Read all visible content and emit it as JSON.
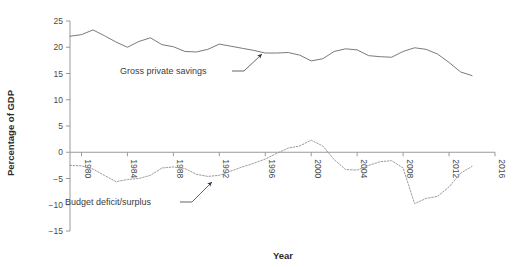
{
  "chart_data": {
    "type": "line",
    "title": "",
    "subtitle": "",
    "xlabel": "Year",
    "ylabel": "Percentage of GDP",
    "xlim": [
      1979,
      2016
    ],
    "ylim": [
      -15,
      25
    ],
    "xticks": [
      "1980",
      "1984",
      "1988",
      "1992",
      "1996",
      "2000",
      "2004",
      "2008",
      "2012",
      "2016"
    ],
    "xtick_values": [
      1980,
      1984,
      1988,
      1992,
      1996,
      2000,
      2004,
      2008,
      2012,
      2016
    ],
    "yticks": [
      "25",
      "20",
      "15",
      "10",
      "5",
      "0",
      "−5",
      "−10",
      "−15"
    ],
    "ytick_values": [
      25,
      20,
      15,
      10,
      5,
      0,
      -5,
      -10,
      -15
    ],
    "grid": false,
    "legend_position": "inline-annotations",
    "series": [
      {
        "name": "Gross private savings",
        "style": "solid",
        "color": "#7a7a7a",
        "x": [
          1979,
          1980,
          1981,
          1982,
          1983,
          1984,
          1985,
          1986,
          1987,
          1988,
          1989,
          1990,
          1991,
          1992,
          1993,
          1994,
          1995,
          1996,
          1997,
          1998,
          1999,
          2000,
          2001,
          2002,
          2003,
          2004,
          2005,
          2006,
          2007,
          2008,
          2009,
          2010,
          2011,
          2012,
          2013,
          2014
        ],
        "values": [
          22.1,
          22.4,
          23.3,
          22.2,
          21.0,
          20.0,
          21.1,
          21.8,
          20.5,
          20.1,
          19.2,
          19.1,
          19.6,
          20.6,
          20.2,
          19.8,
          19.4,
          18.9,
          18.9,
          19.0,
          18.5,
          17.4,
          17.8,
          19.2,
          19.7,
          19.5,
          18.4,
          18.2,
          18.1,
          19.2,
          19.9,
          19.6,
          18.7,
          17.1,
          15.3,
          14.6
        ]
      },
      {
        "name": "Budget deficit/surplus",
        "style": "dotted",
        "color": "#9b9b9b",
        "x": [
          1979,
          1980,
          1981,
          1982,
          1983,
          1984,
          1985,
          1986,
          1987,
          1988,
          1989,
          1990,
          1991,
          1992,
          1993,
          1994,
          1995,
          1996,
          1997,
          1998,
          1999,
          2000,
          2001,
          2002,
          2003,
          2004,
          2005,
          2006,
          2007,
          2008,
          2009,
          2010,
          2011,
          2012,
          2013,
          2014
        ],
        "values": [
          -2.5,
          -2.6,
          -3.2,
          -4.4,
          -5.6,
          -5.2,
          -5.0,
          -4.4,
          -3.0,
          -2.8,
          -3.1,
          -4.2,
          -4.6,
          -4.4,
          -3.6,
          -2.8,
          -2.1,
          -1.3,
          -0.2,
          0.8,
          1.2,
          2.3,
          1.2,
          -1.4,
          -3.3,
          -3.4,
          -2.5,
          -1.8,
          -1.6,
          -3.0,
          -9.8,
          -8.8,
          -8.4,
          -6.6,
          -4.0,
          -2.7
        ]
      }
    ],
    "annotations": [
      {
        "text": "Gross private savings",
        "points_to_series": "Gross private savings",
        "x": 120,
        "y": 74
      },
      {
        "text": "Budget deficit/surplus",
        "points_to_series": "Budget deficit/surplus",
        "x": 65,
        "y": 205
      }
    ]
  }
}
